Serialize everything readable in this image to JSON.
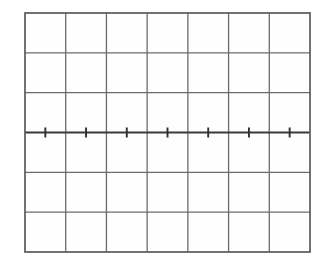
{
  "figure": {
    "kind": "graticule-grid",
    "title": "",
    "caption": "",
    "background_color": "#ffffff"
  },
  "chart_data": {
    "type": "line",
    "title": "",
    "subtitle": "",
    "xlabel": "",
    "ylabel": "",
    "series": [
      {
        "name": "baseline-trace",
        "description": "flat horizontal trace along the central axis",
        "x": [
          0,
          1,
          2,
          3,
          4,
          5,
          6,
          7
        ],
        "values": [
          0,
          0,
          0,
          0,
          0,
          0,
          0,
          0
        ]
      }
    ],
    "categories": [
      "0",
      "1",
      "2",
      "3",
      "4",
      "5",
      "6",
      "7"
    ],
    "x": [
      0,
      1,
      2,
      3,
      4,
      5,
      6,
      7
    ],
    "xlim": [
      0,
      7
    ],
    "ylim": [
      -3,
      3
    ],
    "xtick_labels": [],
    "ytick_labels": [],
    "legend": [],
    "legend_position": "none",
    "annotations": [],
    "grid": true,
    "grid_columns": 7,
    "grid_rows": 6,
    "axis_row_index": 3,
    "minor_tick_count": 7,
    "minor_tick_values": [
      0.5,
      1.5,
      2.5,
      3.5,
      4.5,
      5.5,
      6.5
    ]
  },
  "geometry": {
    "plot_left": 25,
    "plot_top": 13,
    "plot_right": 310,
    "plot_bottom": 252,
    "plot_width": 285,
    "plot_height": 239,
    "column_width": 40.71,
    "row_height": 39.83,
    "axis_y": 132.5,
    "tick_half_length": 5
  },
  "style": {
    "grid_line_color": "#6b6b6b",
    "grid_line_width": 1.3,
    "border_color": "#5a5a5a",
    "border_width": 1.7,
    "axis_line_color": "#3a3a3a",
    "axis_line_width": 2.0,
    "tick_color": "#2e2e2e",
    "tick_width": 1.9,
    "plot_fill": "#fefefe"
  }
}
